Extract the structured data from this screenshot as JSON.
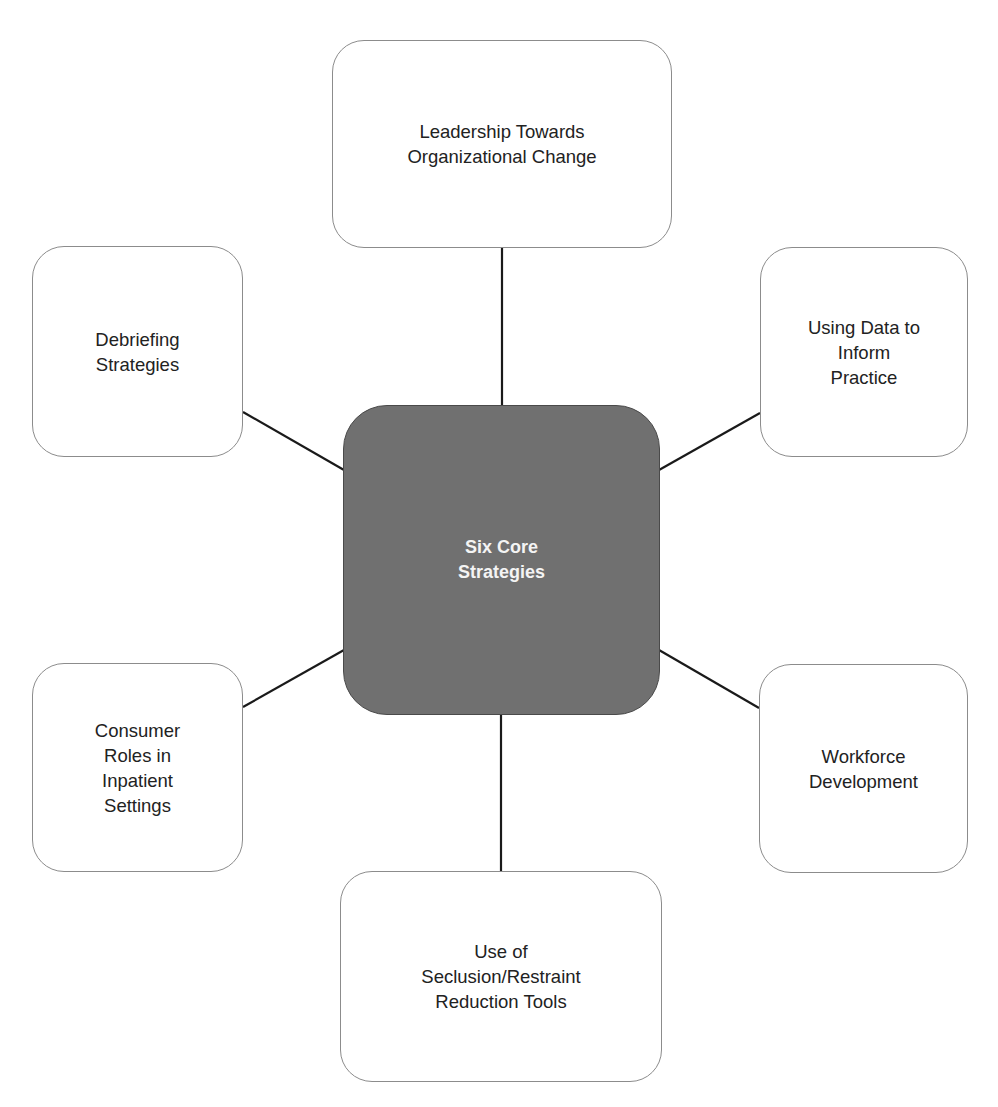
{
  "diagram": {
    "type": "hub-and-spoke",
    "center": {
      "label": "Six Core\nStrategies",
      "fill": "#707070",
      "text_color": "#f4f4f4"
    },
    "nodes": [
      {
        "id": "top",
        "label": "Leadership Towards\nOrganizational Change"
      },
      {
        "id": "upper-left",
        "label": "Debriefing\nStrategies"
      },
      {
        "id": "upper-right",
        "label": "Using Data to\nInform\nPractice"
      },
      {
        "id": "lower-left",
        "label": "Consumer\nRoles in\nInpatient\nSettings"
      },
      {
        "id": "lower-right",
        "label": "Workforce\nDevelopment"
      },
      {
        "id": "bottom",
        "label": "Use of\nSeclusion/Restraint\nReduction Tools"
      }
    ],
    "colors": {
      "node_border": "#8c8c8c",
      "connector": "#1a1a1a",
      "text": "#222222"
    }
  }
}
